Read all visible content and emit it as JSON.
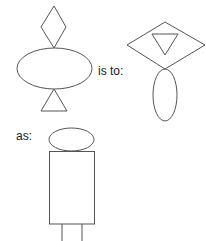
{
  "diagram": {
    "type": "visual-analogy",
    "stroke_color": "#555555",
    "fill_color": "#ffffff",
    "text_color": "#222222",
    "labels": {
      "is_to": "is to:",
      "as": "as:"
    },
    "figure_a": {
      "description": "Horizontal ellipse with small diamond on top and upright triangle below",
      "shapes": [
        "diamond",
        "ellipse-horizontal",
        "triangle-up"
      ]
    },
    "figure_b": {
      "description": "Wide diamond containing inverted triangle, with vertical ellipse below",
      "shapes": [
        "diamond-wide",
        "triangle-down-inside",
        "ellipse-vertical"
      ]
    },
    "figure_c": {
      "description": "Small horizontal ellipse on top of tall rectangle with two legs below",
      "shapes": [
        "ellipse-horizontal-small",
        "rectangle-tall",
        "leg-lines"
      ]
    }
  }
}
